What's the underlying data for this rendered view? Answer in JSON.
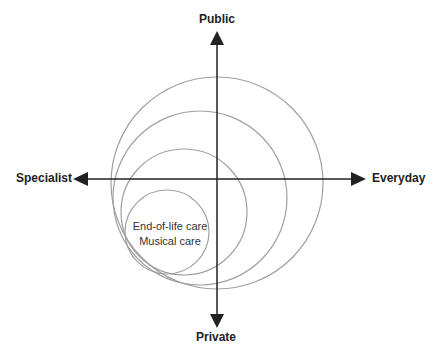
{
  "axes": {
    "top": "Public",
    "bottom": "Private",
    "left": "Specialist",
    "right": "Everyday"
  },
  "circles": [
    {
      "cx": 217,
      "cy": 183,
      "r": 106
    },
    {
      "cx": 200,
      "cy": 198,
      "r": 87
    },
    {
      "cx": 184,
      "cy": 212,
      "r": 63
    },
    {
      "cx": 167,
      "cy": 232,
      "r": 42
    }
  ],
  "inner_labels": {
    "line1": "End-of-life care",
    "line2": "Musical care"
  },
  "colors": {
    "axis": "#222222",
    "circle": "#a0a0a0"
  }
}
